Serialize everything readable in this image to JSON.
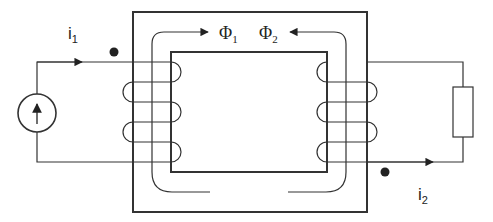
{
  "diagram": {
    "type": "transformer-circuit",
    "labels": {
      "i1": {
        "base": "i",
        "sub": "1"
      },
      "i2": {
        "base": "i",
        "sub": "2"
      },
      "phi1": {
        "base": "Φ",
        "sub": "1"
      },
      "phi2": {
        "base": "Φ",
        "sub": "2"
      }
    },
    "components": {
      "source": "current-source",
      "load": "resistor",
      "core": "magnetic-core",
      "primary_coil_turns": 3,
      "secondary_coil_turns": 3
    },
    "colors": {
      "line": "#333333",
      "background": "#ffffff"
    }
  }
}
